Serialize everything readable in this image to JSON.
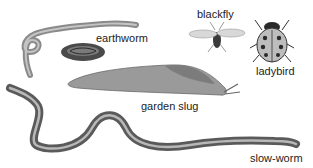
{
  "figure": {
    "labels": {
      "earthworm": "earthworm",
      "blackfly": "blackfly",
      "ladybird": "ladybird",
      "garden_slug": "garden slug",
      "slow_worm": "slow-worm"
    },
    "colors": {
      "background": "#ffffff",
      "text": "#1c1c1c",
      "worm": "#8a8a8a",
      "slug": "#9a9a9a",
      "slow_worm": "#7a7a7a",
      "ladybird_shell": "#bdbdbd",
      "ladybird_spots": "#2a2a2a"
    }
  }
}
